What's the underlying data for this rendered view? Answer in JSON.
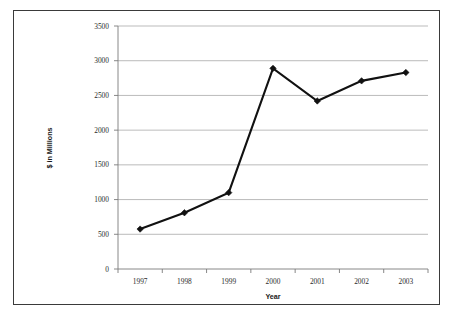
{
  "chart_data": {
    "type": "line",
    "title": "",
    "xlabel": "Year",
    "ylabel": "$ in Millions",
    "categories": [
      "1997",
      "1998",
      "1999",
      "2000",
      "2001",
      "2002",
      "2003"
    ],
    "values": [
      575,
      810,
      1100,
      2890,
      2420,
      2710,
      2830
    ],
    "series": [
      {
        "name": "",
        "values": [
          575,
          810,
          1100,
          2890,
          2420,
          2710,
          2830
        ]
      }
    ],
    "ylim": [
      0,
      3500
    ],
    "yticks": [
      0,
      500,
      1000,
      1500,
      2000,
      2500,
      3000,
      3500
    ],
    "ytick_labels": [
      "0",
      "500",
      "1000",
      "1500",
      "2000",
      "2500",
      "3000",
      "3500"
    ],
    "xtick_labels": [
      "1997",
      "1998",
      "1999",
      "2000",
      "2001",
      "2002",
      "2003"
    ],
    "grid": "horizontal",
    "legend": "none",
    "marker": "diamond",
    "line_color": "#111111",
    "grid_color": "#a9a9a9",
    "axis_color": "#7a7a7a",
    "border_color": "#3a3a3a",
    "background_color": "#ffffff"
  }
}
